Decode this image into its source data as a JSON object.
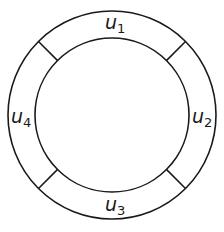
{
  "diagram": {
    "type": "annulus-partition",
    "center": [
      112,
      115
    ],
    "outer_radius": 104,
    "inner_radius": 77,
    "divider_angles_deg": [
      45,
      135,
      225,
      315
    ],
    "regions": [
      {
        "id": "u1",
        "base": "u",
        "subscript": "1",
        "position": "top"
      },
      {
        "id": "u2",
        "base": "u",
        "subscript": "2",
        "position": "right"
      },
      {
        "id": "u3",
        "base": "u",
        "subscript": "3",
        "position": "bottom"
      },
      {
        "id": "u4",
        "base": "u",
        "subscript": "4",
        "position": "left"
      }
    ],
    "stroke_color": "#1a1a1a",
    "background_color": "#ffffff"
  }
}
